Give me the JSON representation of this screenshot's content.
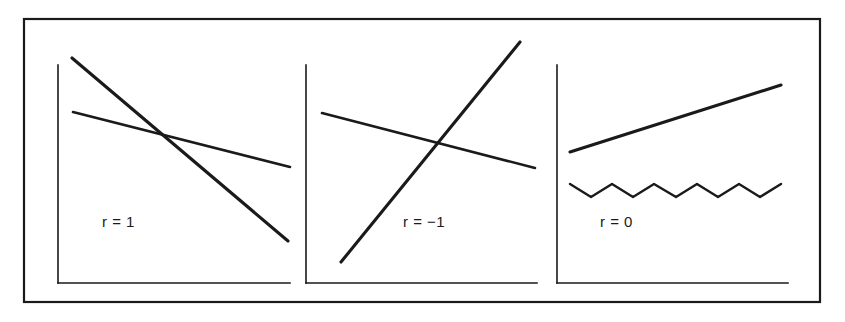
{
  "figure": {
    "background_color": "#ffffff",
    "ink_color": "#1a1a1a",
    "border": {
      "name": "outer-frame",
      "x": 24,
      "y": 19,
      "width": 796,
      "height": 283,
      "stroke_width": 2.2
    }
  },
  "chart_data": {
    "type": "line",
    "xlabel": "",
    "ylabel": "",
    "grid": false,
    "legend": "none",
    "panel_count": 3,
    "panels": [
      {
        "id": "panel-r-1",
        "label": "r = 1",
        "label_x": 102,
        "label_y": 227,
        "axis": {
          "y_axis": {
            "x": 58,
            "y_top": 65,
            "y_bottom": 283
          },
          "x_axis": {
            "y": 283,
            "x_left": 58,
            "x_right": 290
          }
        },
        "series": [
          {
            "name": "steep-descending-line",
            "stroke_width": 3.1,
            "points": [
              [
                72,
                58
              ],
              [
                288,
                241
              ]
            ]
          },
          {
            "name": "shallow-descending-line",
            "stroke_width": 2.6,
            "points": [
              [
                73,
                112
              ],
              [
                290,
                167
              ]
            ]
          }
        ]
      },
      {
        "id": "panel-r-minus-1",
        "label": "r = −1",
        "label_x": 403,
        "label_y": 227,
        "axis": {
          "y_axis": {
            "x": 306,
            "y_top": 65,
            "y_bottom": 283
          },
          "x_axis": {
            "y": 283,
            "x_left": 306,
            "x_right": 537
          }
        },
        "series": [
          {
            "name": "steep-ascending-line",
            "stroke_width": 3.1,
            "points": [
              [
                341,
                262
              ],
              [
                520,
                42
              ]
            ]
          },
          {
            "name": "shallow-descending-line",
            "stroke_width": 2.6,
            "points": [
              [
                322,
                113
              ],
              [
                535,
                168
              ]
            ]
          }
        ]
      },
      {
        "id": "panel-r-0",
        "label": "r = 0",
        "label_x": 600,
        "label_y": 227,
        "axis": {
          "y_axis": {
            "x": 557,
            "y_top": 65,
            "y_bottom": 283
          },
          "x_axis": {
            "y": 283,
            "x_left": 557,
            "x_right": 788
          }
        },
        "series": [
          {
            "name": "ascending-line",
            "stroke_width": 3.1,
            "points": [
              [
                570,
                152
              ],
              [
                781,
                85
              ]
            ]
          },
          {
            "name": "zigzag-line",
            "stroke_width": 2.4,
            "points": [
              [
                570,
                184
              ],
              [
                591,
                197
              ],
              [
                612,
                184
              ],
              [
                633,
                197
              ],
              [
                654,
                184
              ],
              [
                676,
                197
              ],
              [
                697,
                184
              ],
              [
                718,
                197
              ],
              [
                739,
                184
              ],
              [
                760,
                197
              ],
              [
                781,
                184
              ]
            ]
          }
        ]
      }
    ]
  }
}
